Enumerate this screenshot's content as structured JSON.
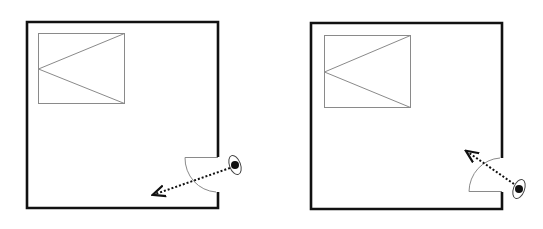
{
  "diagram": {
    "type": "floor-plan-comparison",
    "background": "#ffffff",
    "colors": {
      "wall": "#111111",
      "furniture": "#8a8a8a",
      "door": "#8a8a8a",
      "arrow": "#111111",
      "eye": "#111111"
    },
    "panels": [
      {
        "id": "left",
        "description": "Room with door opening inward, swing hinged at top; viewer outside looking in toward lower-left",
        "room": {
          "x": 27,
          "y": 22,
          "width": 191,
          "height": 186
        },
        "door_gap": {
          "wall": "right",
          "y_top": 157,
          "y_bottom": 192
        },
        "door_swing": "hinge-top",
        "bed": {
          "x": 38,
          "y": 33,
          "width": 86,
          "height": 70
        },
        "eye": {
          "cx": 235,
          "cy": 165
        },
        "sight_arrow": {
          "from": [
            230,
            168
          ],
          "to": [
            152,
            195
          ]
        }
      },
      {
        "id": "right",
        "description": "Room with door opening inward, swing hinged at bottom; viewer outside looking in toward upper-left",
        "room": {
          "x": 311,
          "y": 23,
          "width": 191,
          "height": 186
        },
        "door_gap": {
          "wall": "right",
          "y_top": 158,
          "y_bottom": 192
        },
        "door_swing": "hinge-bottom",
        "bed": {
          "x": 324,
          "y": 35,
          "width": 86,
          "height": 72
        },
        "eye": {
          "cx": 519,
          "cy": 189
        },
        "sight_arrow": {
          "from": [
            514,
            184
          ],
          "to": [
            465,
            150
          ]
        }
      }
    ]
  }
}
